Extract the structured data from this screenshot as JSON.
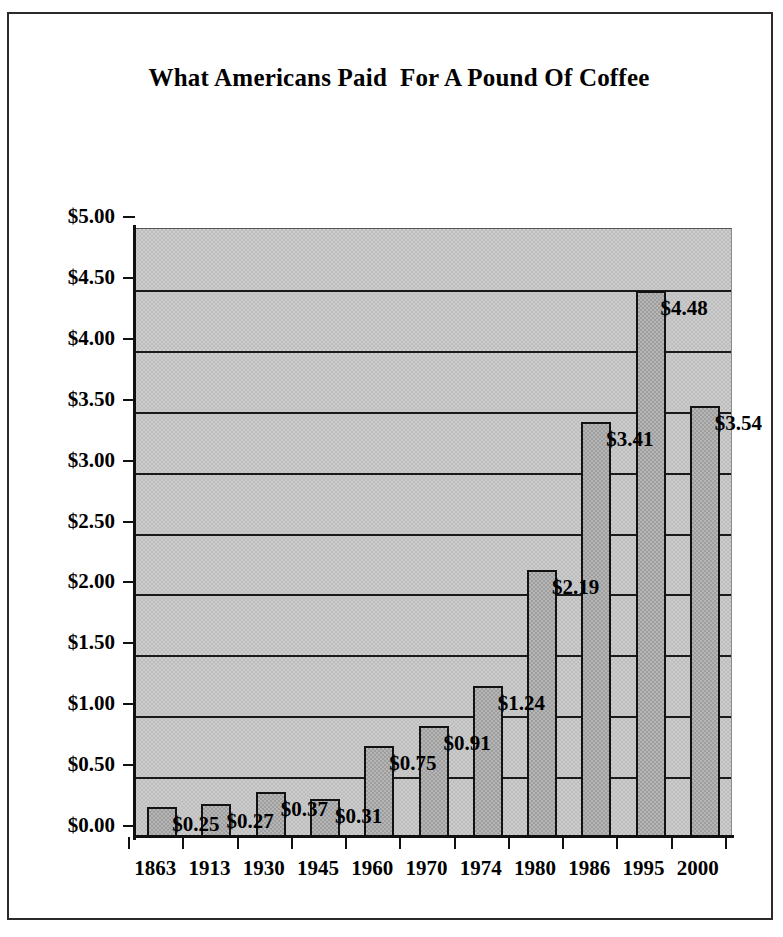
{
  "chart_data": {
    "type": "bar",
    "title": "What Americans Paid  For A Pound Of Coffee",
    "xlabel": "",
    "ylabel": "",
    "ylim": [
      0,
      5
    ],
    "grid": true,
    "legend": "none",
    "categories": [
      "1863",
      "1913",
      "1930",
      "1945",
      "1960",
      "1970",
      "1974",
      "1980",
      "1986",
      "1995",
      "2000"
    ],
    "values": [
      0.25,
      0.27,
      0.37,
      0.31,
      0.75,
      0.91,
      1.24,
      2.19,
      3.41,
      4.48,
      3.54
    ],
    "data_labels": [
      "$0.25",
      "$0.27",
      "$0.37",
      "$0.31",
      "$0.75",
      "$0.91",
      "$1.24",
      "$2.19",
      "$3.41",
      "$4.48",
      "$3.54"
    ],
    "ytick_values": [
      0,
      0.5,
      1,
      1.5,
      2,
      2.5,
      3,
      3.5,
      4,
      4.5,
      5
    ],
    "ytick_labels": [
      "$0.00",
      "$0.50",
      "$1.00",
      "$1.50",
      "$2.00",
      "$2.50",
      "$3.00",
      "$3.50",
      "$4.00",
      "$4.50",
      "$5.00"
    ],
    "colors": {
      "bar_fill": "#b5b5b5",
      "bar_outline": "#121212",
      "plot_background": "#cccccc",
      "gridline": "#1a1a1a",
      "axis": "#101010",
      "text": "#000000",
      "frame_border": "#2b2b2b",
      "page_background": "#ffffff"
    }
  }
}
